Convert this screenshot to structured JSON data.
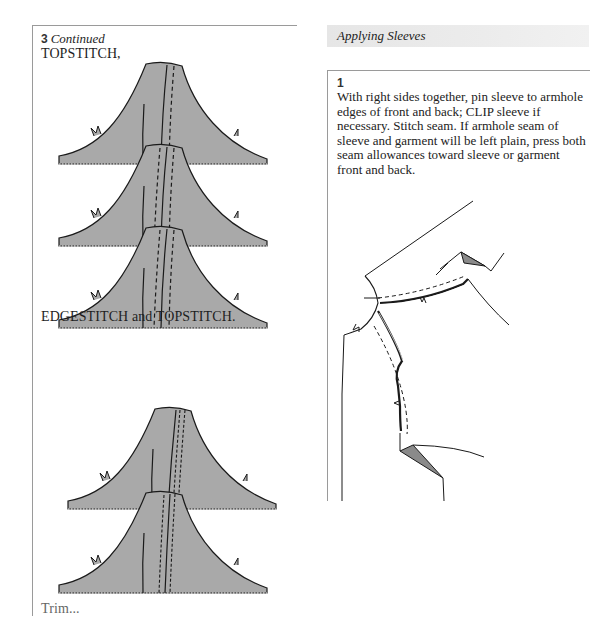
{
  "left_column": {
    "step_number": "3",
    "step_continued": "Continued",
    "caption_topstitch": "TOPSTITCH,",
    "caption_edgestitch": "EDGESTITCH and TOPSTITCH.",
    "caption_bottom_partial": "Trim..."
  },
  "right_column": {
    "section_title": "Applying Sleeves",
    "step": {
      "number": "1",
      "text": "With right sides together, pin sleeve to armhole edges of front and back; CLIP sleeve if necessary. Stitch seam. If armhole seam of sleeve and garment will be left plain, press both seam allowances toward sleeve or garment front and back."
    }
  },
  "colors": {
    "fabric_fill": "#a9a9a9",
    "fold_fill": "#8a8a8a",
    "line": "#1a1a1a",
    "section_band": "#e8e8e8",
    "border": "#9a9a9a"
  },
  "figures": [
    {
      "name": "topstitch-seam-diagrams",
      "count": 3
    },
    {
      "name": "edgestitch-topstitch-seam-diagrams",
      "count": 2
    },
    {
      "name": "sleeve-armhole-diagram",
      "count": 1
    }
  ]
}
